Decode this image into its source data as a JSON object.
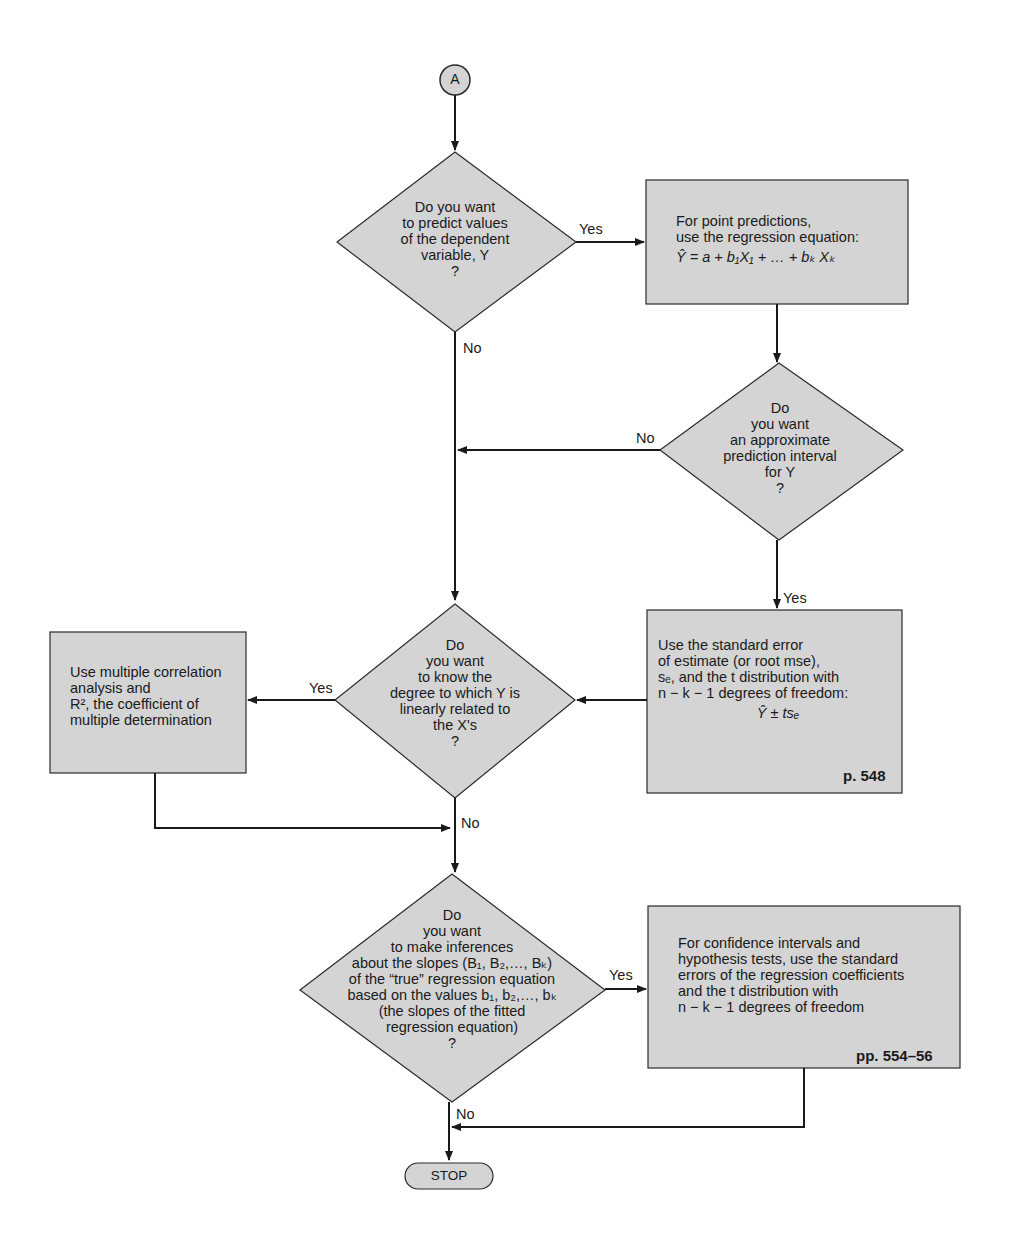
{
  "diagram": {
    "type": "flowchart",
    "start": {
      "label": "A"
    },
    "end": {
      "label": "STOP"
    },
    "decisions": [
      {
        "id": "d1",
        "lines": [
          "Do you want",
          "to predict values",
          "of the dependent",
          "variable, Y",
          "?"
        ]
      },
      {
        "id": "d2",
        "lines": [
          "Do",
          "you want",
          "an approximate",
          "prediction interval",
          "for Y",
          "?"
        ]
      },
      {
        "id": "d3",
        "lines": [
          "Do",
          "you want",
          "to know the",
          "degree to which Y is",
          "linearly related to",
          "the X's",
          "?"
        ]
      },
      {
        "id": "d4",
        "lines": [
          "Do",
          "you want",
          "to make inferences",
          "about the slopes (B₁, B₂,…, Bₖ)",
          "of the “true” regression equation",
          "based on the values b₁, b₂,…, bₖ",
          "(the slopes of the fitted",
          "regression equation)",
          "?"
        ]
      }
    ],
    "processes": [
      {
        "id": "p1",
        "lines": [
          "For point predictions,",
          "use the regression equation:",
          "Ŷ = a + b₁X₁ + … + bₖ Xₖ"
        ],
        "page": ""
      },
      {
        "id": "p2",
        "lines": [
          "Use the standard error",
          "of estimate (or root mse),",
          "sₑ, and the t distribution with",
          "n − k − 1 degrees of freedom:",
          "Ŷ ± tsₑ"
        ],
        "page": "p. 548"
      },
      {
        "id": "p3",
        "lines": [
          "Use multiple correlation",
          "analysis and",
          "R², the coefficient of",
          "multiple determination"
        ],
        "page": ""
      },
      {
        "id": "p4",
        "lines": [
          "For confidence intervals and",
          "hypothesis tests, use the standard",
          "errors of the regression coefficients",
          "and the t distribution with",
          "n − k − 1 degrees of freedom"
        ],
        "page": "pp. 554–56"
      }
    ],
    "edge_labels": {
      "d1_yes": "Yes",
      "d1_no": "No",
      "d2_no": "No",
      "d2_yes": "Yes",
      "d3_yes": "Yes",
      "d3_no": "No",
      "d4_yes": "Yes",
      "d4_no": "No"
    },
    "colors": {
      "fill": "#d4d4d4",
      "stroke": "#2a2a2a",
      "background": "#ffffff"
    }
  }
}
